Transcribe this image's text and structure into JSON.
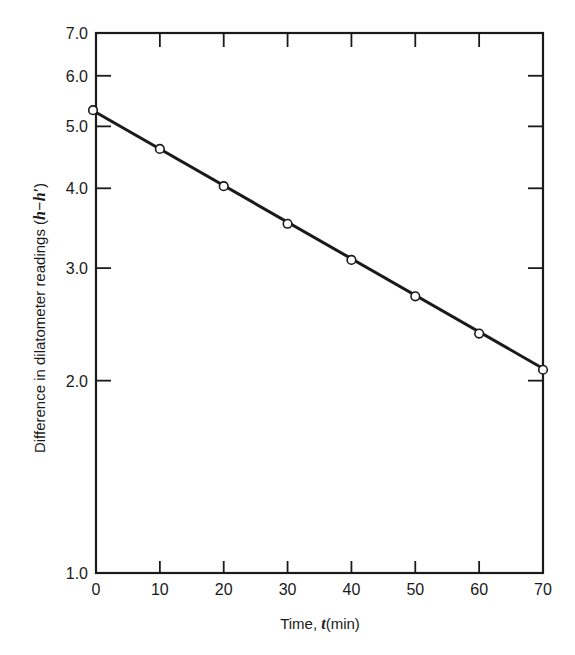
{
  "chart_data": {
    "type": "line",
    "title": "",
    "xlabel": "Time, t(min)",
    "xlabel_parts": {
      "prefix": "Time, ",
      "italic": "t",
      "suffix": "(min)"
    },
    "ylabel": "Difference in dilatometer readings (h−h′)",
    "ylabel_parts": {
      "prefix": "Difference in dilatometer readings (",
      "italic": "h−h′",
      "suffix": ")"
    },
    "yscale": "log",
    "xlim": [
      0,
      70
    ],
    "ylim": [
      1.0,
      7.0
    ],
    "x_ticks": [
      0,
      10,
      20,
      30,
      40,
      50,
      60,
      70
    ],
    "x_tick_labels": [
      "0",
      "10",
      "20",
      "30",
      "40",
      "50",
      "60",
      "70"
    ],
    "y_ticks": [
      1.0,
      2.0,
      3.0,
      4.0,
      5.0,
      6.0,
      7.0
    ],
    "y_tick_labels": [
      "1.0",
      "2.0",
      "3.0",
      "4.0",
      "5.0",
      "6.0",
      "7.0"
    ],
    "grid": false,
    "legend": null,
    "series": [
      {
        "name": "h − h′",
        "marker": "open-circle",
        "line": "straight fit",
        "x": [
          0,
          10,
          20,
          30,
          40,
          50,
          60,
          70
        ],
        "values": [
          5.3,
          4.61,
          4.03,
          3.52,
          3.09,
          2.71,
          2.37,
          2.08
        ]
      }
    ],
    "fit_line": {
      "x": [
        0,
        70
      ],
      "y": [
        5.28,
        2.09
      ]
    }
  },
  "colors": {
    "ink": "#1a1a1a",
    "background": "#ffffff",
    "marker_fill": "#ffffff"
  }
}
